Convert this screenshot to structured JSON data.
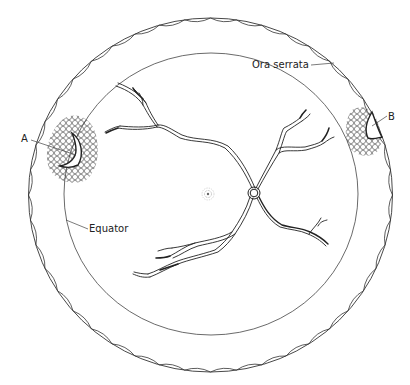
{
  "diagram": {
    "labels": {
      "ora_serrata": "Ora serrata",
      "equator": "Equator",
      "break_a": "A",
      "break_b": "B"
    },
    "structures": [
      {
        "id": "ora-serrata",
        "label": "Ora serrata",
        "shape": "scalloped outer circle"
      },
      {
        "id": "equator",
        "label": "Equator",
        "shape": "inner circle"
      },
      {
        "id": "optic-disc",
        "shape": "small ring at vessel origin"
      },
      {
        "id": "macula",
        "shape": "stippled spot"
      },
      {
        "id": "lesion-a",
        "label": "A",
        "shape": "horseshoe tear surrounded by cryo/laser scars, left at equator"
      },
      {
        "id": "lesion-b",
        "label": "B",
        "shape": "tear near ora serrata surrounded by scars, right"
      }
    ],
    "colors": {
      "line": "#333333",
      "background": "#ffffff"
    }
  }
}
